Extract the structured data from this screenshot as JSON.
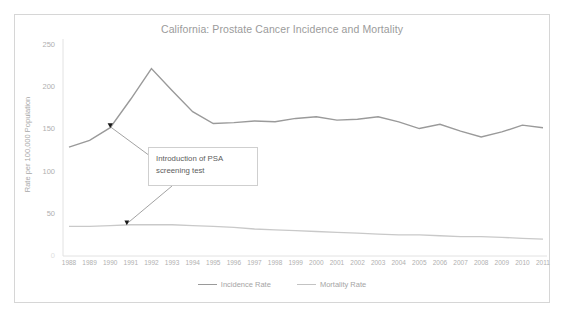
{
  "chart_data": {
    "type": "line",
    "title": "California: Prostate Cancer Incidence and Mortality",
    "xlabel": "",
    "ylabel": "Rate per 100,000 Population",
    "ylim": [
      0,
      250
    ],
    "yticks": [
      0,
      50,
      100,
      150,
      200,
      250
    ],
    "ytick_labels": [
      "0",
      "50",
      "100",
      "150",
      "200",
      "250"
    ],
    "grid": false,
    "legend_position": "bottom",
    "categories": [
      "1988",
      "1989",
      "1990",
      "1991",
      "1992",
      "1993",
      "1994",
      "1995",
      "1996",
      "1997",
      "1998",
      "1999",
      "2000",
      "2001",
      "2002",
      "2003",
      "2004",
      "2005",
      "2006",
      "2007",
      "2008",
      "2009",
      "2010",
      "2011"
    ],
    "series": [
      {
        "name": "Incidence Rate",
        "color": "#9a9a9a",
        "values": [
          129,
          137,
          152,
          186,
          222,
          196,
          171,
          157,
          158,
          160,
          159,
          163,
          165,
          161,
          162,
          165,
          159,
          151,
          156,
          148,
          141,
          147,
          155,
          152
        ]
      },
      {
        "name": "Mortality Rate",
        "color": "#c3c3c3",
        "values": [
          35,
          35,
          36,
          37,
          37,
          37,
          36,
          35,
          34,
          32,
          31,
          30,
          29,
          28,
          27,
          26,
          25,
          25,
          24,
          23,
          23,
          22,
          21,
          20
        ]
      }
    ],
    "annotation": {
      "line1": "Introduction of PSA",
      "line2": "screening test"
    }
  },
  "legend": {
    "items": [
      {
        "label": "Incidence Rate",
        "color": "#9a9a9a"
      },
      {
        "label": "Mortality Rate",
        "color": "#c3c3c3"
      }
    ]
  }
}
